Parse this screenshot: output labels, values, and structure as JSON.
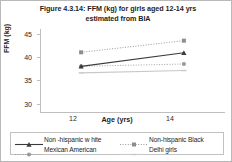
{
  "figure": {
    "title": "Figure 4.3.14: FFM (kg) for girls aged 12-14 yrs estimated from BIA",
    "border_color": "#b9b9b9"
  },
  "chart_data": {
    "type": "line",
    "title": "Figure 4.3.14: FFM (kg) for girls aged 12-14 yrs estimated from BIA",
    "xlabel": "Age (yrs)",
    "ylabel": "FFM (kg)",
    "categories": [
      "12",
      "14"
    ],
    "x": [
      12,
      14
    ],
    "xlim": [
      11.2,
      14.8
    ],
    "ylim": [
      28,
      46
    ],
    "yticks": [
      30,
      35,
      40,
      45
    ],
    "ytick_labels": [
      "30",
      "35",
      "40",
      "45"
    ],
    "grid": false,
    "legend_position": "bottom",
    "series": [
      {
        "name": "Non -hispanic w hite",
        "values": [
          38.0,
          40.9
        ],
        "color": "#3b3b3b",
        "line_style": "solid",
        "marker": "triangle"
      },
      {
        "name": "Non-hispanic Black",
        "values": [
          41.0,
          43.5
        ],
        "color": "#8d8d8d",
        "line_style": "dotted",
        "marker": "square"
      },
      {
        "name": "Mexican American",
        "values": [
          38.0,
          38.5
        ],
        "color": "#9a9a9a",
        "line_style": "dotted",
        "marker": "circle"
      },
      {
        "name": "Delhi girls",
        "values": [
          36.6,
          37.1
        ],
        "color": "#c8c8c8",
        "line_style": "solid",
        "marker": "dash"
      }
    ]
  },
  "legend": {
    "rows": [
      [
        {
          "label": "Non -hispanic w hite"
        },
        {
          "label": "Non-hispanic Black"
        }
      ],
      [
        {
          "label": "Mexican American"
        },
        {
          "label": "Delhi girls"
        }
      ]
    ]
  }
}
